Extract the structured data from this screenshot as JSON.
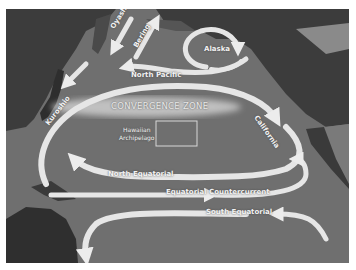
{
  "map": {
    "title": "North Pacific Ocean Currents",
    "colors": {
      "ocean": "#6f6f6f",
      "land": "#3c3c3c",
      "land_light": "#8a8a8a",
      "current": "#e6e6e6",
      "convergence": "#bdbdbd",
      "background": "#ffffff"
    },
    "labels": {
      "oyashio": "Oyashio",
      "bering": "Bering",
      "alaska": "Alaska",
      "north_pacific": "North Pacific",
      "kuroshio": "Kuroshio",
      "convergence_zone": "CONVERGENCE ZONE",
      "california": "California",
      "hawaiian_1": "Hawaiian",
      "hawaiian_2": "Archipelago",
      "north_equatorial": "North Equatorial",
      "equatorial_countercurrent": "Equatorial Countercurrent",
      "south_equatorial": "South Equatorial"
    }
  }
}
